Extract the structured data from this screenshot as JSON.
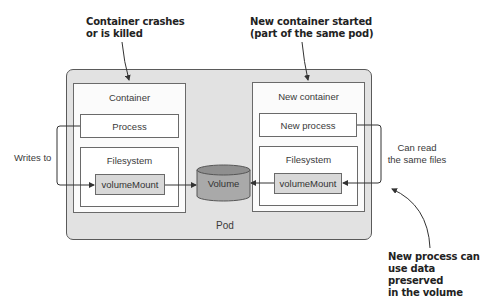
{
  "annotations": {
    "crash": {
      "line1": "Container crashes",
      "line2": "or is killed"
    },
    "new_container": {
      "line1": "New container started",
      "line2": "(part of the same pod)"
    },
    "new_process": {
      "line1": "New process can",
      "line2": "use data preserved",
      "line3": "in the volume"
    }
  },
  "side_labels": {
    "writes_to": "Writes to",
    "can_read": {
      "line1": "Can read",
      "line2": "the same files"
    }
  },
  "pod": {
    "label": "Pod",
    "volume": {
      "label": "Volume"
    },
    "containers": [
      {
        "title": "Container",
        "process": "Process",
        "filesystem": "Filesystem",
        "mount": "volumeMount"
      },
      {
        "title": "New container",
        "process": "New process",
        "filesystem": "Filesystem",
        "mount": "volumeMount"
      }
    ]
  },
  "colors": {
    "pod_fill": "#e2e2e2",
    "mount_fill": "#d8d8d8",
    "volume_fill": "#a9a9a9",
    "stroke": "#5a5a5a"
  }
}
